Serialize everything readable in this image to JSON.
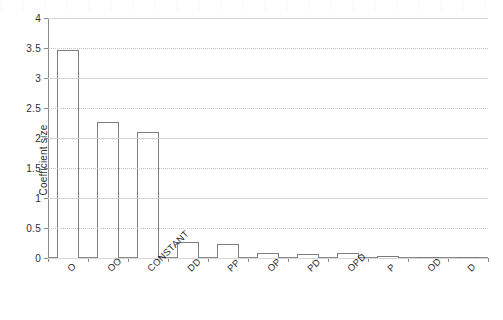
{
  "chart_data": {
    "type": "bar",
    "title": "",
    "xlabel": "",
    "ylabel": "Coefficient size",
    "ylim": [
      0,
      4
    ],
    "yticks": [
      0,
      0.5,
      1,
      1.5,
      2,
      2.5,
      3,
      3.5,
      4
    ],
    "ytick_labels": [
      "0",
      "0.5",
      "1",
      "1.5",
      "2",
      "2.5",
      "3",
      "3.5",
      "4"
    ],
    "grid": true,
    "legend": "none",
    "categories": [
      "O",
      "OO",
      "CONSTANT",
      "DD",
      "PP",
      "OP",
      "PD",
      "OPD",
      "P",
      "OD",
      "D"
    ],
    "values": [
      3.46,
      2.27,
      2.1,
      0.27,
      0.23,
      0.08,
      0.07,
      0.08,
      0.04,
      0.02,
      0.01
    ],
    "series": [
      {
        "name": "Coefficient size",
        "values": [
          3.46,
          2.27,
          2.1,
          0.27,
          0.23,
          0.08,
          0.07,
          0.08,
          0.04,
          0.02,
          0.01
        ]
      }
    ]
  },
  "colors": {
    "bar_fill": "#ffffff",
    "bar_border": "#7d7d7d",
    "axis": "#8a8a8a",
    "gridline": "#c3c3c3",
    "text": "#2e2e2e",
    "background": "#ffffff"
  }
}
